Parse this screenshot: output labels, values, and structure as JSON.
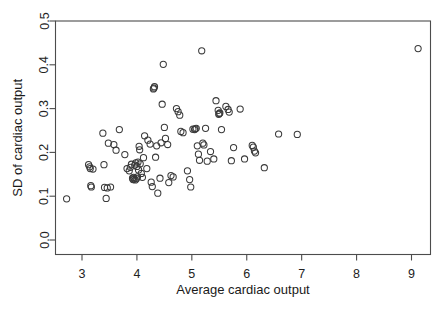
{
  "chart_data": {
    "type": "scatter",
    "title": "",
    "xlabel": "Average cardiac output",
    "ylabel": "SD of cardiac output",
    "xlim": [
      2.5,
      9.3
    ],
    "ylim": [
      0.0,
      0.5
    ],
    "xticks": [
      3,
      4,
      5,
      6,
      7,
      8,
      9
    ],
    "xtick_labels": [
      "3",
      "4",
      "5",
      "6",
      "7",
      "8",
      "9"
    ],
    "yticks": [
      0.0,
      0.1,
      0.2,
      0.3,
      0.4,
      0.5
    ],
    "ytick_labels": [
      "0.0",
      "0.1",
      "0.2",
      "0.3",
      "0.4",
      "0.5"
    ],
    "grid": false,
    "legend": null,
    "marker": "open-circle",
    "marker_color": "#3a3a3a",
    "n_points": 104,
    "points": [
      [
        2.72,
        0.094
      ],
      [
        3.12,
        0.172
      ],
      [
        3.15,
        0.163
      ],
      [
        3.16,
        0.124
      ],
      [
        3.17,
        0.121
      ],
      [
        3.2,
        0.162
      ],
      [
        3.38,
        0.244
      ],
      [
        3.4,
        0.172
      ],
      [
        3.41,
        0.12
      ],
      [
        3.44,
        0.095
      ],
      [
        3.46,
        0.119
      ],
      [
        3.48,
        0.221
      ],
      [
        3.52,
        0.121
      ],
      [
        3.58,
        0.218
      ],
      [
        3.62,
        0.205
      ],
      [
        3.68,
        0.252
      ],
      [
        3.78,
        0.195
      ],
      [
        3.82,
        0.163
      ],
      [
        3.86,
        0.158
      ],
      [
        3.88,
        0.166
      ],
      [
        3.9,
        0.173
      ],
      [
        3.92,
        0.141
      ],
      [
        3.93,
        0.138
      ],
      [
        3.94,
        0.143
      ],
      [
        3.95,
        0.139
      ],
      [
        3.96,
        0.171
      ],
      [
        3.98,
        0.176
      ],
      [
        4.0,
        0.168
      ],
      [
        4.01,
        0.144
      ],
      [
        4.02,
        0.178
      ],
      [
        4.04,
        0.214
      ],
      [
        4.05,
        0.206
      ],
      [
        4.06,
        0.174
      ],
      [
        4.08,
        0.152
      ],
      [
        4.1,
        0.143
      ],
      [
        4.12,
        0.188
      ],
      [
        4.14,
        0.238
      ],
      [
        4.2,
        0.228
      ],
      [
        4.24,
        0.219
      ],
      [
        4.26,
        0.132
      ],
      [
        4.28,
        0.122
      ],
      [
        4.3,
        0.345
      ],
      [
        4.32,
        0.35
      ],
      [
        4.34,
        0.189
      ],
      [
        4.36,
        0.215
      ],
      [
        4.38,
        0.107
      ],
      [
        4.42,
        0.141
      ],
      [
        4.46,
        0.31
      ],
      [
        4.48,
        0.401
      ],
      [
        4.5,
        0.257
      ],
      [
        4.52,
        0.232
      ],
      [
        4.56,
        0.218
      ],
      [
        4.58,
        0.131
      ],
      [
        4.62,
        0.147
      ],
      [
        4.66,
        0.144
      ],
      [
        4.72,
        0.3
      ],
      [
        4.75,
        0.293
      ],
      [
        4.78,
        0.285
      ],
      [
        4.8,
        0.248
      ],
      [
        4.84,
        0.245
      ],
      [
        4.92,
        0.158
      ],
      [
        4.96,
        0.138
      ],
      [
        4.98,
        0.121
      ],
      [
        5.02,
        0.253
      ],
      [
        5.05,
        0.252
      ],
      [
        5.08,
        0.255
      ],
      [
        5.1,
        0.215
      ],
      [
        5.12,
        0.196
      ],
      [
        5.14,
        0.182
      ],
      [
        5.18,
        0.432
      ],
      [
        5.2,
        0.221
      ],
      [
        5.22,
        0.217
      ],
      [
        5.25,
        0.255
      ],
      [
        5.28,
        0.18
      ],
      [
        5.34,
        0.202
      ],
      [
        5.4,
        0.185
      ],
      [
        5.44,
        0.318
      ],
      [
        5.48,
        0.296
      ],
      [
        5.5,
        0.289
      ],
      [
        5.51,
        0.29
      ],
      [
        5.54,
        0.252
      ],
      [
        5.62,
        0.305
      ],
      [
        5.66,
        0.298
      ],
      [
        5.68,
        0.292
      ],
      [
        5.72,
        0.181
      ],
      [
        5.76,
        0.211
      ],
      [
        5.88,
        0.299
      ],
      [
        5.96,
        0.185
      ],
      [
        6.1,
        0.216
      ],
      [
        6.14,
        0.203
      ],
      [
        6.16,
        0.199
      ],
      [
        6.32,
        0.165
      ],
      [
        6.58,
        0.242
      ],
      [
        6.92,
        0.241
      ],
      [
        9.12,
        0.437
      ],
      [
        4.18,
        0.163
      ],
      [
        3.99,
        0.14
      ],
      [
        3.97,
        0.137
      ],
      [
        4.03,
        0.16
      ],
      [
        5.06,
        0.254
      ],
      [
        4.31,
        0.347
      ],
      [
        5.49,
        0.287
      ],
      [
        3.14,
        0.167
      ],
      [
        4.44,
        0.222
      ],
      [
        6.12,
        0.212
      ]
    ]
  },
  "axes": {
    "frame_color": "#4c4c4c"
  }
}
